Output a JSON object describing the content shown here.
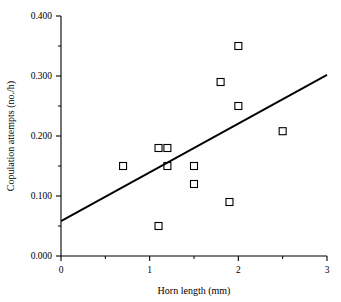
{
  "chart_data": {
    "type": "scatter",
    "title": "",
    "xlabel": "Horn length (mm)",
    "ylabel": "Copulation attempts (no./h)",
    "xlim": [
      0,
      3
    ],
    "ylim": [
      0.0,
      0.4
    ],
    "grid": false,
    "legend": "none",
    "x_ticks": [
      {
        "value": 0,
        "label": "0",
        "major": true
      },
      {
        "value": 0.5,
        "label": "",
        "major": false
      },
      {
        "value": 1,
        "label": "1",
        "major": true
      },
      {
        "value": 1.5,
        "label": "",
        "major": false
      },
      {
        "value": 2,
        "label": "2",
        "major": true
      },
      {
        "value": 2.5,
        "label": "",
        "major": false
      },
      {
        "value": 3,
        "label": "3",
        "major": true
      }
    ],
    "y_ticks": [
      {
        "value": 0.0,
        "label": "0.000",
        "major": true
      },
      {
        "value": 0.05,
        "label": "",
        "major": false
      },
      {
        "value": 0.1,
        "label": "0.100",
        "major": true
      },
      {
        "value": 0.15,
        "label": "",
        "major": false
      },
      {
        "value": 0.2,
        "label": "0.200",
        "major": true
      },
      {
        "value": 0.25,
        "label": "",
        "major": false
      },
      {
        "value": 0.3,
        "label": "0.300",
        "major": true
      },
      {
        "value": 0.35,
        "label": "",
        "major": false
      },
      {
        "value": 0.4,
        "label": "0.400",
        "major": true
      }
    ],
    "marker_style": "open-square",
    "marker_color": "#000000",
    "points": [
      {
        "x": 0.7,
        "y": 0.15
      },
      {
        "x": 1.1,
        "y": 0.18
      },
      {
        "x": 1.2,
        "y": 0.18
      },
      {
        "x": 1.2,
        "y": 0.15
      },
      {
        "x": 1.1,
        "y": 0.05
      },
      {
        "x": 1.5,
        "y": 0.15
      },
      {
        "x": 1.5,
        "y": 0.12
      },
      {
        "x": 1.8,
        "y": 0.29
      },
      {
        "x": 1.9,
        "y": 0.09
      },
      {
        "x": 2.0,
        "y": 0.35
      },
      {
        "x": 2.0,
        "y": 0.25
      },
      {
        "x": 2.5,
        "y": 0.208
      }
    ],
    "series": [
      {
        "name": "regression-line",
        "type": "line",
        "color": "#000000",
        "endpoints": [
          {
            "x": 0.0,
            "y": 0.058
          },
          {
            "x": 3.0,
            "y": 0.302
          }
        ],
        "slope": 0.0813,
        "intercept": 0.058
      }
    ]
  }
}
